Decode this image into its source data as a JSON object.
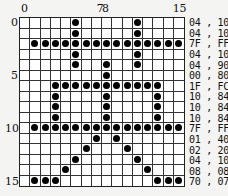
{
  "column_labels": [
    {
      "text": "0",
      "col": 0
    },
    {
      "text": "7",
      "col": 7
    },
    {
      "text": "8",
      "col": 8
    },
    {
      "text": "15",
      "col": 15
    }
  ],
  "row_labels": [
    {
      "text": "0",
      "row": 0
    },
    {
      "text": "5",
      "row": 5
    },
    {
      "text": "10",
      "row": 10
    },
    {
      "text": "15",
      "row": 15
    }
  ],
  "rows": [
    {
      "hex": "04 , 10",
      "cols": [
        5,
        11
      ]
    },
    {
      "hex": "04 , 10",
      "cols": [
        5,
        11
      ]
    },
    {
      "hex": "7F , FF",
      "cols": [
        1,
        2,
        3,
        4,
        5,
        6,
        7,
        8,
        9,
        10,
        11,
        12,
        13,
        14,
        15
      ]
    },
    {
      "hex": "04 , 10",
      "cols": [
        5,
        11
      ]
    },
    {
      "hex": "04 , 90",
      "cols": [
        5,
        8,
        11
      ]
    },
    {
      "hex": "00 , 80",
      "cols": [
        8
      ]
    },
    {
      "hex": "1F , FC",
      "cols": [
        3,
        4,
        5,
        6,
        7,
        8,
        9,
        10,
        11,
        12,
        13
      ]
    },
    {
      "hex": "10 , 84",
      "cols": [
        3,
        8,
        13
      ]
    },
    {
      "hex": "10 , 84",
      "cols": [
        3,
        8,
        13
      ]
    },
    {
      "hex": "10 , 84",
      "cols": [
        3,
        8,
        13
      ]
    },
    {
      "hex": "7F , FF",
      "cols": [
        1,
        2,
        3,
        4,
        5,
        6,
        7,
        8,
        9,
        10,
        11,
        12,
        13,
        14,
        15
      ]
    },
    {
      "hex": "01 , 40",
      "cols": [
        7,
        9
      ]
    },
    {
      "hex": "02 , 20",
      "cols": [
        6,
        10
      ]
    },
    {
      "hex": "04 , 10",
      "cols": [
        5,
        11
      ]
    },
    {
      "hex": "08 , 08",
      "cols": [
        4,
        12
      ]
    },
    {
      "hex": "70 , 07",
      "cols": [
        1,
        2,
        3,
        13,
        14,
        15
      ]
    }
  ]
}
